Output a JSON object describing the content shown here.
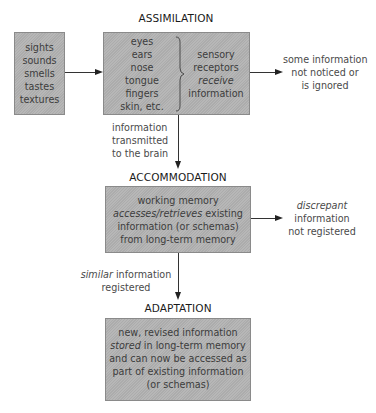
{
  "assimilation": {
    "title": "ASSIMILATION",
    "stimuli": [
      "sights",
      "sounds",
      "smells",
      "tastes",
      "textures"
    ],
    "organs": [
      "eyes",
      "ears",
      "nose",
      "tongue",
      "fingers",
      "skin, etc."
    ],
    "receptors": {
      "line1": "sensory",
      "line2": "receptors",
      "line3_italic": "receive",
      "line4": "information"
    },
    "ignored_note": [
      "some information",
      "not noticed or",
      "is ignored"
    ],
    "transmit_note": [
      "information",
      "transmitted",
      "to the brain"
    ]
  },
  "accommodation": {
    "title": "ACCOMMODATION",
    "box": {
      "line1": "working memory",
      "line2_italic": "accesses/retrieves",
      "line2_rest": " existing",
      "line3": "information (or schemas)",
      "line4": "from long-term memory"
    },
    "discrepant_note": {
      "line1_italic": "discrepant",
      "line2": "information",
      "line3": "not registered"
    },
    "similar_note": {
      "line1_italic": "similar",
      "line1_rest": " information",
      "line2": "registered"
    }
  },
  "adaptation": {
    "title": "ADAPTATION",
    "box": {
      "line1": "new, revised information",
      "line2_italic": "stored",
      "line2_rest": " in long-term memory",
      "line3": "and can now be accessed as",
      "line4": "part of existing information",
      "line5": "(or schemas)"
    }
  },
  "colors": {
    "box_fill": "#b3b3b3",
    "box_border": "#8a8a8a",
    "line": "#333333"
  }
}
